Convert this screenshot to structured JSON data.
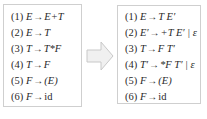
{
  "left_grammar": {
    "title": "Original grammar",
    "rules": [
      {
        "num": "(1)",
        "lhs": "E",
        "arrow": "→",
        "rhs": "E+T"
      },
      {
        "num": "(2)",
        "lhs": "E",
        "arrow": "→",
        "rhs": "T"
      },
      {
        "num": "(3)",
        "lhs": "T",
        "arrow": "→",
        "rhs": "T*F"
      },
      {
        "num": "(4)",
        "lhs": "T",
        "arrow": "→",
        "rhs": "F"
      },
      {
        "num": "(5)",
        "lhs": "F",
        "arrow": "→",
        "rhs": "(E)"
      },
      {
        "num": "(6)",
        "lhs": "F",
        "arrow": "→",
        "rhs": "id"
      }
    ]
  },
  "transform_arrow": {
    "icon": "right-arrow-icon",
    "fill": "#f0f0f0",
    "stroke": "#c8c8c8"
  },
  "right_grammar": {
    "title": "Grammar after eliminating left recursion",
    "rules": [
      {
        "num": "(1)",
        "lhs": "E",
        "arrow": "→",
        "rhs": "T E′"
      },
      {
        "num": "(2)",
        "lhs": "E′",
        "arrow": "→",
        "rhs": "+T E′ | ε"
      },
      {
        "num": "(3)",
        "lhs": "T",
        "arrow": "→",
        "rhs": "F T′"
      },
      {
        "num": "(4)",
        "lhs": "T′",
        "arrow": "→",
        "rhs": "*F T′ | ε"
      },
      {
        "num": "(5)",
        "lhs": "F",
        "arrow": "→",
        "rhs": "(E)"
      },
      {
        "num": "(6)",
        "lhs": "F",
        "arrow": "→",
        "rhs": "id"
      }
    ]
  },
  "colors": {
    "border": "#cfcfcf",
    "text": "#2a2a2a"
  }
}
